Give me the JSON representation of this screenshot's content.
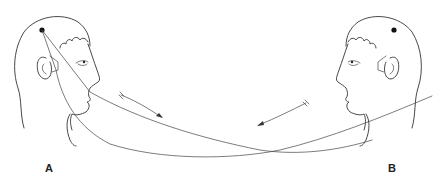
{
  "figure": {
    "panels": [
      {
        "id": "A",
        "label": "A",
        "facing": "right",
        "arrow_direction": "down-right"
      },
      {
        "id": "B",
        "label": "B",
        "facing": "left",
        "arrow_direction": "down-left"
      }
    ],
    "colors": {
      "line": "#333333",
      "dot": "#111111",
      "background": "#ffffff"
    }
  }
}
